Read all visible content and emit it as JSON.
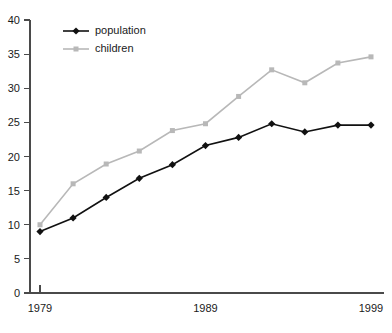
{
  "chart_data": {
    "type": "line",
    "title": "",
    "xlabel": "",
    "ylabel": "",
    "x": [
      1979,
      1981,
      1983,
      1985,
      1987,
      1989,
      1991,
      1993,
      1995,
      1997,
      1999
    ],
    "xlim": [
      1979,
      1999
    ],
    "ylim": [
      0,
      40
    ],
    "grid": false,
    "legend_position": "top-left",
    "x_tick_labels": [
      "1979",
      "1989",
      "1999"
    ],
    "x_tick_values": [
      1979,
      1989,
      1999
    ],
    "y_tick_labels": [
      "0",
      "5",
      "10",
      "15",
      "20",
      "25",
      "30",
      "35",
      "40"
    ],
    "y_tick_values": [
      0,
      5,
      10,
      15,
      20,
      25,
      30,
      35,
      40
    ],
    "series": [
      {
        "name": "population",
        "color": "#111111",
        "marker": "diamond",
        "values": [
          9.0,
          11.0,
          14.0,
          16.8,
          18.8,
          21.6,
          22.8,
          24.8,
          23.6,
          24.6,
          24.6
        ]
      },
      {
        "name": "children",
        "color": "#b8b8b8",
        "marker": "square",
        "values": [
          10.0,
          16.0,
          18.9,
          20.8,
          23.8,
          24.8,
          28.8,
          32.7,
          30.8,
          33.7,
          34.6
        ]
      }
    ]
  },
  "legend": {
    "items": [
      {
        "label": "population"
      },
      {
        "label": "children"
      }
    ]
  },
  "colors": {
    "axis": "#4a4a4a",
    "population": "#111111",
    "children": "#b8b8b8",
    "background": "#ffffff"
  }
}
